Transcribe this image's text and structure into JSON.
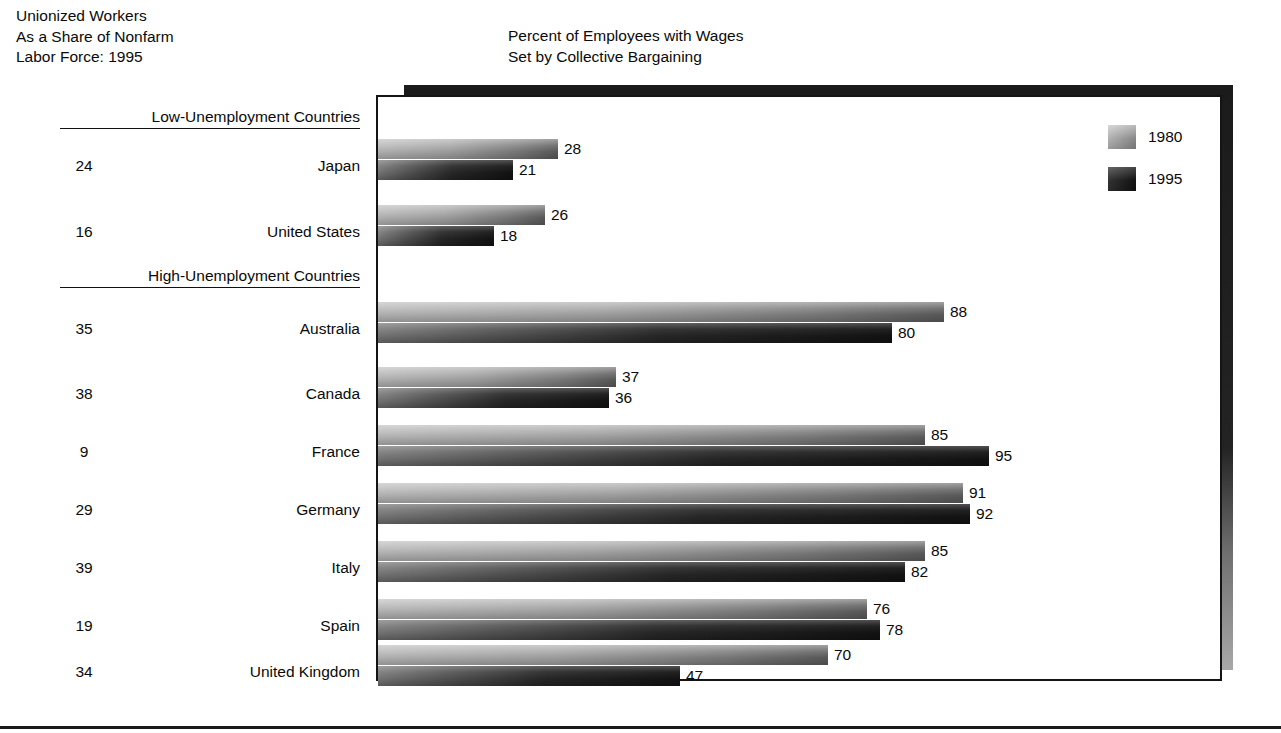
{
  "headers": {
    "left": "Unionized Workers\nAs a Share of Nonfarm\nLabor Force: 1995",
    "middle": "Percent of Employees with Wages\nSet by Collective Bargaining"
  },
  "legend": {
    "items": [
      {
        "label": "1980",
        "color": "#a5a5a5",
        "swatch": "s1980"
      },
      {
        "label": "1995",
        "color": "#1c1c1c",
        "swatch": "s1995"
      }
    ]
  },
  "groups": [
    {
      "label": "Low-Unemployment Countries"
    },
    {
      "label": "High-Unemployment Countries"
    }
  ],
  "rows": [
    {
      "share": "24",
      "country": "Japan",
      "v1980": "28",
      "v1995": "21",
      "group": 0
    },
    {
      "share": "16",
      "country": "United States",
      "v1980": "26",
      "v1995": "18",
      "group": 0
    },
    {
      "share": "35",
      "country": "Australia",
      "v1980": "88",
      "v1995": "80",
      "group": 1
    },
    {
      "share": "38",
      "country": "Canada",
      "v1980": "37",
      "v1995": "36",
      "group": 1
    },
    {
      "share": "9",
      "country": "France",
      "v1980": "85",
      "v1995": "95",
      "group": 1
    },
    {
      "share": "29",
      "country": "Germany",
      "v1980": "91",
      "v1995": "92",
      "group": 1
    },
    {
      "share": "39",
      "country": "Italy",
      "v1980": "85",
      "v1995": "82",
      "group": 1
    },
    {
      "share": "19",
      "country": "Spain",
      "v1980": "76",
      "v1995": "78",
      "group": 1
    },
    {
      "share": "34",
      "country": "United Kingdom",
      "v1980": "70",
      "v1995": "47",
      "group": 1
    }
  ],
  "chart_data": {
    "type": "bar",
    "title": "Percent of Employees with Wages Set by Collective Bargaining",
    "subtitle": "Unionized Workers As a Share of Nonfarm Labor Force: 1995",
    "orientation": "horizontal",
    "xlabel": "",
    "ylabel": "",
    "xlim": [
      0,
      95
    ],
    "grid": false,
    "legend_position": "top-right",
    "categories": [
      "Japan",
      "United States",
      "Australia",
      "Canada",
      "France",
      "Germany",
      "Italy",
      "Spain",
      "United Kingdom"
    ],
    "groups": {
      "Low-Unemployment Countries": [
        "Japan",
        "United States"
      ],
      "High-Unemployment Countries": [
        "Australia",
        "Canada",
        "France",
        "Germany",
        "Italy",
        "Spain",
        "United Kingdom"
      ]
    },
    "series": [
      {
        "name": "1980",
        "values": [
          28,
          26,
          88,
          37,
          85,
          91,
          85,
          76,
          70
        ]
      },
      {
        "name": "1995",
        "values": [
          21,
          18,
          80,
          36,
          95,
          92,
          82,
          78,
          47
        ]
      }
    ],
    "annotations": {
      "unionized_share_of_nonfarm_labor_force_1995": [
        24,
        16,
        35,
        38,
        9,
        29,
        39,
        19,
        34
      ]
    }
  },
  "layout": {
    "px_per_unit": 6.43,
    "row_tops": [
      139,
      205,
      302,
      367,
      425,
      483,
      541,
      599,
      645
    ],
    "group_tops": [
      108,
      267
    ],
    "label_right": 360,
    "share_left": 58
  }
}
